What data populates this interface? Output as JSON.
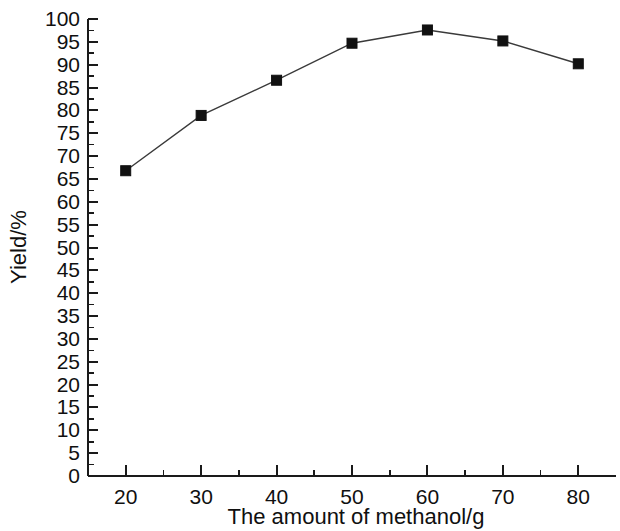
{
  "chart_data": {
    "type": "line",
    "title": "",
    "subtitle": "",
    "xlabel": "The amount of methanol/g",
    "ylabel": "Yield/%",
    "x": [
      20,
      30,
      40,
      50,
      60,
      70,
      80
    ],
    "values": [
      66.8,
      78.9,
      86.6,
      94.7,
      97.6,
      95.2,
      90.2
    ],
    "series": [
      {
        "name": "Yield",
        "x": [
          20,
          30,
          40,
          50,
          60,
          70,
          80
        ],
        "values": [
          66.8,
          78.9,
          86.6,
          94.7,
          97.6,
          95.2,
          90.2
        ],
        "marker": "filled-square",
        "marker_color": "#111111",
        "line_color": "#3a3a3a"
      }
    ],
    "xlim": [
      15,
      85
    ],
    "ylim": [
      0,
      100
    ],
    "x_tick_labels": [
      "20",
      "30",
      "40",
      "50",
      "60",
      "70",
      "80"
    ],
    "x_major_ticks": [
      20,
      30,
      40,
      50,
      60,
      70,
      80
    ],
    "x_minor_ticks": [
      25,
      35,
      45,
      55,
      65,
      75
    ],
    "y_tick_labels": [
      "0",
      "5",
      "10",
      "15",
      "20",
      "25",
      "30",
      "35",
      "40",
      "45",
      "50",
      "55",
      "60",
      "65",
      "70",
      "75",
      "80",
      "85",
      "90",
      "95",
      "100"
    ],
    "y_major_ticks": [
      0,
      5,
      10,
      15,
      20,
      25,
      30,
      35,
      40,
      45,
      50,
      55,
      60,
      65,
      70,
      75,
      80,
      85,
      90,
      95,
      100
    ],
    "y_minor_ticks": [
      2.5,
      7.5,
      12.5,
      17.5,
      22.5,
      27.5,
      32.5,
      37.5,
      42.5,
      47.5,
      52.5,
      57.5,
      62.5,
      67.5,
      72.5,
      77.5,
      82.5,
      87.5,
      92.5,
      97.5
    ],
    "grid": false,
    "legend": null,
    "legend_position": "none",
    "frame": "left-bottom",
    "background_color": "#ffffff",
    "axis_color": "#1a1a1a"
  }
}
